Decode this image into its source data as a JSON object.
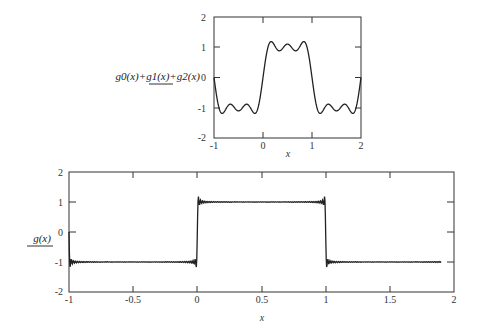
{
  "chart_data": [
    {
      "type": "line",
      "title": "",
      "ylabel": "g0(x)+g1(x)+g2(x)",
      "xlabel": "x",
      "xlim": [
        -1,
        2
      ],
      "ylim": [
        -2,
        2
      ],
      "x_ticks": [
        "-1",
        "0",
        "1",
        "2"
      ],
      "y_ticks": [
        "-2",
        "-1",
        "0",
        "1",
        "2"
      ],
      "grid": false,
      "series": [
        {
          "name": "g0(x)+g1(x)+g2(x)",
          "description": "3-term Fourier partial sum of square wave (-1 on (-1,0), +1 on (0,1)), overshoot peaks ≈ 1.18",
          "terms": 3,
          "x_range": [
            -1,
            2
          ],
          "sample_points": [
            [
              -1,
              0
            ],
            [
              -0.85,
              -1.18
            ],
            [
              -0.5,
              -0.87
            ],
            [
              -0.15,
              -1.18
            ],
            [
              0,
              0
            ],
            [
              0.15,
              1.18
            ],
            [
              0.5,
              0.87
            ],
            [
              0.85,
              1.18
            ],
            [
              1,
              0
            ],
            [
              1.15,
              -1.18
            ],
            [
              1.5,
              -0.87
            ],
            [
              1.85,
              -1.18
            ],
            [
              2,
              0
            ]
          ]
        }
      ]
    },
    {
      "type": "line",
      "title": "",
      "ylabel": "g(x)",
      "xlabel": "x",
      "xlim": [
        -1,
        2
      ],
      "ylim": [
        -2,
        2
      ],
      "x_ticks": [
        "-1",
        "-0.5",
        "0",
        "0.5",
        "1",
        "1.5",
        "2"
      ],
      "y_ticks": [
        "-2",
        "-1",
        "0",
        "1",
        "2"
      ],
      "grid": false,
      "series": [
        {
          "name": "g(x)",
          "description": "many-term Fourier approximation of square wave, plotted from x=-1 to ≈1.9",
          "terms": 60,
          "x_range": [
            -1,
            1.9
          ],
          "sample_points": [
            [
              -1,
              0
            ],
            [
              -0.98,
              -1.0
            ],
            [
              -0.5,
              -1.0
            ],
            [
              -0.01,
              -1.0
            ],
            [
              0,
              0
            ],
            [
              0.01,
              1.0
            ],
            [
              0.5,
              1.0
            ],
            [
              0.99,
              1.0
            ],
            [
              1,
              0
            ],
            [
              1.01,
              -1.0
            ],
            [
              1.5,
              -1.0
            ],
            [
              1.9,
              -1.0
            ]
          ]
        }
      ]
    }
  ],
  "top_plot": {
    "fn_label": "g0(x)+g1(x)+g2(x)",
    "x_title": "x",
    "x_ticks": [
      "-1",
      "0",
      "1",
      "2"
    ],
    "y_ticks": [
      "2",
      "1",
      "0",
      "-1",
      "-2"
    ]
  },
  "bottom_plot": {
    "fn_label": "g(x)",
    "x_title": "x",
    "x_ticks": [
      "-1",
      "-0.5",
      "0",
      "0.5",
      "1",
      "1.5",
      "2"
    ],
    "y_ticks": [
      "2",
      "1",
      "0",
      "-1",
      "-2"
    ]
  }
}
